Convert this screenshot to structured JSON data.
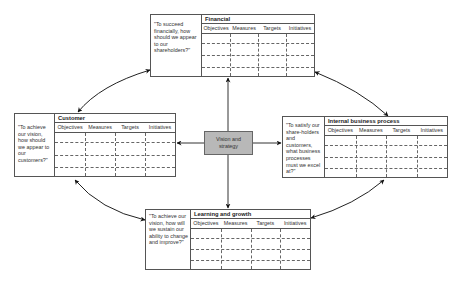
{
  "center": {
    "label_line1": "Vision and",
    "label_line2": "strategy"
  },
  "columns": [
    "Objectives",
    "Measures",
    "Targets",
    "Initiatives"
  ],
  "perspectives": {
    "financial": {
      "title": "Financial",
      "question": "\"To succeed financially, how should we appear to our shareholders?\""
    },
    "customer": {
      "title": "Customer",
      "question": "\"To achieve our vision, how should we appear to our customers?\""
    },
    "internal": {
      "title": "Internal business process",
      "question": "\"To satisfy our share-holders and customers, what business processes must we excel at?\""
    },
    "learning": {
      "title": "Learning and growth",
      "question": "\"To achieve our vision, how will we sustain our ability to change and improve?\""
    }
  },
  "colors": {
    "center_fill": "#b8b8b8",
    "line": "#222222"
  }
}
